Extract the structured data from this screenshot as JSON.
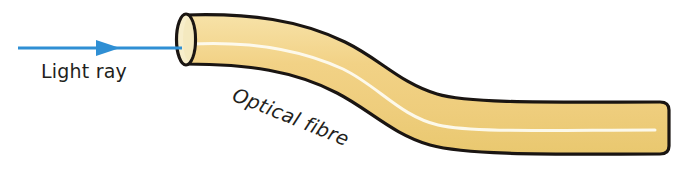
{
  "figure": {
    "background_color": "#ffffff",
    "width": 681,
    "height": 172
  },
  "labels": {
    "light_ray": "Light ray",
    "optical_fibre": "Optical fibre"
  },
  "colors": {
    "ray_blue": "#2f8fd4",
    "fibre_fill": "#f2d285",
    "fibre_fill_light": "#f7e0a4",
    "fibre_outline": "#1a1512",
    "core_highlight": "#fdfbf0",
    "end_face_fill": "#f6ecc4",
    "text": "#231f1c"
  },
  "elements": {
    "ray_arrow": {
      "name": "light-ray-arrow",
      "direction": "right",
      "start_x": 18,
      "end_x": 185,
      "y": 48,
      "stroke_width": 3
    },
    "fibre": {
      "name": "optical-fibre-body",
      "shape": "S-bend cylinder",
      "entry_face": "ellipse",
      "entry_face_cx": 186,
      "entry_face_cy": 48,
      "entry_face_rx": 9,
      "entry_face_ry": 33,
      "exit_end_x": 668
    },
    "core_line": {
      "name": "fibre-core-highlight",
      "description": "white highlight line running along the fibre axis"
    }
  }
}
